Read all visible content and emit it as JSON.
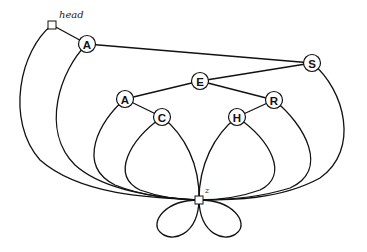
{
  "diagram": {
    "type": "binary-search-tree-with-sentinel",
    "sentinels": [
      {
        "id": "head",
        "label": "head",
        "x": 52,
        "y": 25
      },
      {
        "id": "z",
        "label": "z",
        "x": 199,
        "y": 200
      }
    ],
    "nodes": [
      {
        "id": "A1",
        "label": "A",
        "x": 87,
        "y": 44
      },
      {
        "id": "S",
        "label": "S",
        "x": 312,
        "y": 63
      },
      {
        "id": "E",
        "label": "E",
        "x": 200,
        "y": 81
      },
      {
        "id": "A2",
        "label": "A",
        "x": 125,
        "y": 99
      },
      {
        "id": "R",
        "label": "R",
        "x": 274,
        "y": 100
      },
      {
        "id": "C",
        "label": "C",
        "x": 162,
        "y": 117
      },
      {
        "id": "H",
        "label": "H",
        "x": 237,
        "y": 117
      }
    ],
    "edges": [
      {
        "from": "head",
        "to": "A1",
        "kind": "straight"
      },
      {
        "from": "head",
        "to": "z",
        "kind": "curve"
      },
      {
        "from": "A1",
        "to": "S",
        "kind": "straight"
      },
      {
        "from": "A1",
        "to": "z",
        "kind": "curve"
      },
      {
        "from": "S",
        "to": "E",
        "kind": "straight"
      },
      {
        "from": "S",
        "to": "z",
        "kind": "curve"
      },
      {
        "from": "E",
        "to": "A2",
        "kind": "straight"
      },
      {
        "from": "E",
        "to": "R",
        "kind": "straight"
      },
      {
        "from": "A2",
        "to": "z",
        "kind": "curve"
      },
      {
        "from": "A2",
        "to": "C",
        "kind": "straight"
      },
      {
        "from": "C",
        "to": "z",
        "kind": "curve-left"
      },
      {
        "from": "C",
        "to": "z",
        "kind": "curve-right"
      },
      {
        "from": "R",
        "to": "H",
        "kind": "straight"
      },
      {
        "from": "R",
        "to": "z",
        "kind": "curve"
      },
      {
        "from": "H",
        "to": "z",
        "kind": "curve-left"
      },
      {
        "from": "H",
        "to": "z",
        "kind": "curve-right"
      },
      {
        "from": "z",
        "to": "z",
        "kind": "self-loop-left"
      },
      {
        "from": "z",
        "to": "z",
        "kind": "self-loop-right"
      }
    ]
  }
}
